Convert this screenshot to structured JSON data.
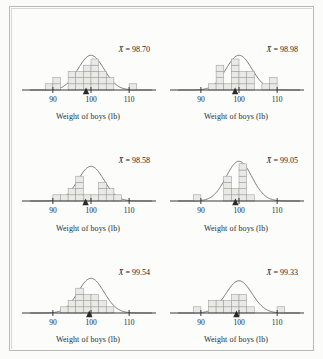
{
  "figure": {
    "title": "",
    "axis_label": "Weight of boys (lb)",
    "mean_symbol": "X̄",
    "equals": "="
  },
  "chart_data": [
    {
      "type": "bar",
      "title": "",
      "xlabel": "Weight of boys (lb)",
      "ylabel": "",
      "mean_label": "X̄ = 98.70",
      "mean": 98.7,
      "xlim": [
        84,
        116
      ],
      "ticks": [
        90,
        100,
        110
      ],
      "tick_labels": [
        "90",
        "100",
        "110"
      ],
      "bin_width": 2,
      "bin_starts": [
        88,
        90,
        92,
        94,
        96,
        98,
        100,
        102,
        104,
        110
      ],
      "categories": [
        "88",
        "90",
        "92",
        "94",
        "96",
        "98",
        "100",
        "102",
        "104",
        "110"
      ],
      "values": [
        1,
        2,
        0,
        3,
        3,
        4,
        5,
        3,
        2,
        1
      ],
      "curve": {
        "mu": 100.0,
        "sigma": 3.4,
        "peak": 5.6
      },
      "grid": false,
      "legend": "none"
    },
    {
      "type": "bar",
      "title": "",
      "xlabel": "Weight of boys (lb)",
      "ylabel": "",
      "mean_label": "X̄ = 98.98",
      "mean": 98.98,
      "xlim": [
        84,
        116
      ],
      "ticks": [
        90,
        100,
        110
      ],
      "tick_labels": [
        "90",
        "100",
        "110"
      ],
      "bin_width": 2,
      "bin_starts": [
        92,
        94,
        96,
        98,
        100,
        102,
        106,
        108
      ],
      "categories": [
        "92",
        "94",
        "96",
        "98",
        "100",
        "102",
        "106",
        "108"
      ],
      "values": [
        1,
        4,
        1,
        5,
        3,
        3,
        1,
        2
      ],
      "curve": {
        "mu": 100.0,
        "sigma": 3.4,
        "peak": 5.6
      },
      "grid": false,
      "legend": "none"
    },
    {
      "type": "bar",
      "title": "",
      "xlabel": "Weight of boys (lb)",
      "ylabel": "",
      "mean_label": "X̄ = 98.58",
      "mean": 98.58,
      "xlim": [
        84,
        116
      ],
      "ticks": [
        90,
        100,
        110
      ],
      "tick_labels": [
        "90",
        "100",
        "110"
      ],
      "bin_width": 2,
      "bin_starts": [
        90,
        92,
        94,
        96,
        98,
        100,
        102,
        104,
        106
      ],
      "categories": [
        "90",
        "92",
        "94",
        "96",
        "98",
        "100",
        "102",
        "104",
        "106"
      ],
      "values": [
        1,
        1,
        2,
        4,
        1,
        1,
        3,
        2,
        1
      ],
      "curve": {
        "mu": 100.0,
        "sigma": 3.4,
        "peak": 5.6
      },
      "grid": false,
      "legend": "none"
    },
    {
      "type": "bar",
      "title": "",
      "xlabel": "Weight of boys (lb)",
      "ylabel": "",
      "mean_label": "X̄ = 99.05",
      "mean": 99.05,
      "xlim": [
        84,
        116
      ],
      "ticks": [
        90,
        100,
        110
      ],
      "tick_labels": [
        "90",
        "100",
        "110"
      ],
      "bin_width": 2,
      "bin_starts": [
        88,
        96,
        98,
        100,
        102
      ],
      "categories": [
        "88",
        "96",
        "98",
        "100",
        "102"
      ],
      "values": [
        1,
        4,
        2,
        6,
        1
      ],
      "curve": {
        "mu": 100.0,
        "sigma": 3.4,
        "peak": 6.4
      },
      "grid": false,
      "legend": "none"
    },
    {
      "type": "bar",
      "title": "",
      "xlabel": "Weight of boys (lb)",
      "ylabel": "",
      "mean_label": "X̄ = 99.54",
      "mean": 99.54,
      "xlim": [
        84,
        116
      ],
      "ticks": [
        90,
        100,
        110
      ],
      "tick_labels": [
        "90",
        "100",
        "110"
      ],
      "bin_width": 2,
      "bin_starts": [
        92,
        94,
        96,
        98,
        100,
        102,
        104
      ],
      "categories": [
        "92",
        "94",
        "96",
        "98",
        "100",
        "102",
        "104"
      ],
      "values": [
        1,
        2,
        4,
        3,
        3,
        2,
        1
      ],
      "curve": {
        "mu": 100.0,
        "sigma": 3.4,
        "peak": 5.6
      },
      "grid": false,
      "legend": "none"
    },
    {
      "type": "bar",
      "title": "",
      "xlabel": "Weight of boys (lb)",
      "ylabel": "",
      "mean_label": "X̄ = 99.33",
      "mean": 99.33,
      "xlim": [
        84,
        116
      ],
      "ticks": [
        90,
        100,
        110
      ],
      "tick_labels": [
        "90",
        "100",
        "110"
      ],
      "bin_width": 2,
      "bin_starts": [
        88,
        92,
        94,
        96,
        98,
        100,
        102,
        110
      ],
      "categories": [
        "88",
        "92",
        "94",
        "96",
        "98",
        "100",
        "102",
        "110"
      ],
      "values": [
        1,
        2,
        2,
        2,
        3,
        3,
        1,
        1
      ],
      "curve": {
        "mu": 100.0,
        "sigma": 3.4,
        "peak": 5.2
      },
      "grid": false,
      "legend": "none"
    }
  ],
  "colors": {
    "background": "#fbfbfa",
    "frame": "#b9b9b9",
    "axis": "#3a3a3a",
    "curve": "#6b6b6b",
    "bar_fill": "#e9e9e6",
    "bar_stroke": "#9a9a9a",
    "text": "#1f1f1f"
  }
}
